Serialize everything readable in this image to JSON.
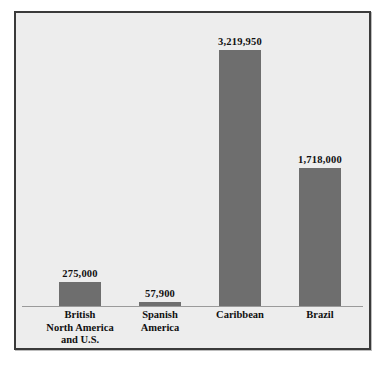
{
  "chart_data": {
    "type": "bar",
    "title": "",
    "subtitle": "",
    "xlabel": "",
    "ylabel": "",
    "grid": false,
    "legend": "none",
    "axis": {
      "y_min": 0,
      "y_max": 3219950,
      "ticks_visible": false,
      "baseline_visible": true
    },
    "categories": [
      "British North America and U.S.",
      "Spanish America",
      "Caribbean",
      "Brazil"
    ],
    "category_lines": [
      [
        "British",
        "North America",
        "and U.S."
      ],
      [
        "Spanish",
        "America"
      ],
      [
        "Caribbean"
      ],
      [
        "Brazil"
      ]
    ],
    "values": [
      275000,
      57900,
      3219950,
      1718000
    ],
    "value_labels": [
      "275,000",
      "57,900",
      "3,219,950",
      "1,718,000"
    ],
    "bar_heights_px": [
      24,
      4,
      256,
      138
    ],
    "colors": {
      "bar_fill": "#6e6e6e",
      "plot_background": "#ededed",
      "frame_border": "#3a3a3a",
      "baseline": "#9a9a9a",
      "label_text": "#101010",
      "page_background": "#ffffff"
    }
  }
}
